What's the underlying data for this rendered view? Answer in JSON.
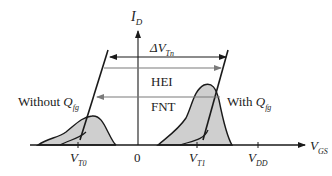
{
  "diagram": {
    "type": "threshold-voltage-distribution",
    "axes": {
      "y_label": {
        "main": "I",
        "sub": "D"
      },
      "x_label": {
        "main": "V",
        "sub": "GS"
      }
    },
    "ticks": {
      "vt0": {
        "main": "V",
        "sub": "T0"
      },
      "zero": "0",
      "vt1": {
        "main": "V",
        "sub": "T1"
      },
      "vdd": {
        "main": "V",
        "sub": "DD"
      }
    },
    "arrows": {
      "delta_vtn": {
        "prefix": "ΔV",
        "sub": "Tn",
        "direction": "both"
      },
      "hei": {
        "label": "HEI",
        "direction": "right"
      },
      "fnt": {
        "label": "FNT",
        "direction": "left"
      }
    },
    "curves": {
      "without": {
        "text": "Without ",
        "q": "Q",
        "sub": "fg"
      },
      "with": {
        "text": "With ",
        "q": "Q",
        "sub": "fg"
      }
    },
    "colors": {
      "line": "#1a1a1a",
      "fill": "#cfcfcf",
      "arrow_gray": "#7a7a7a"
    }
  }
}
